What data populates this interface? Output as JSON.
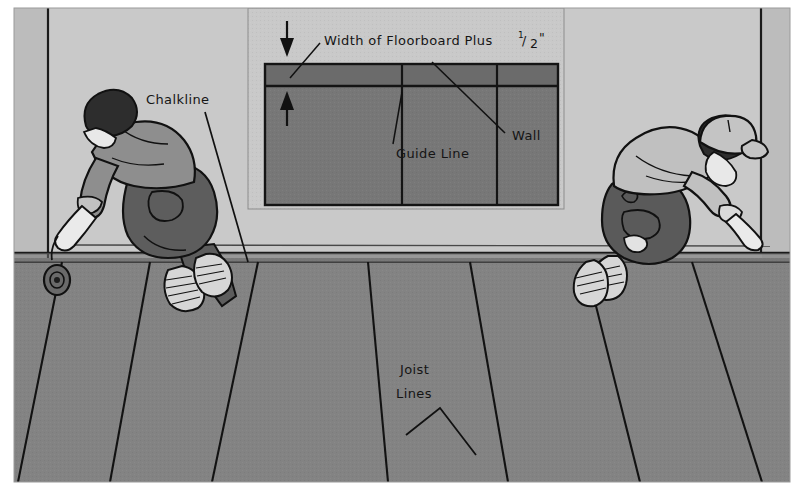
{
  "illustration": {
    "title": "Chalkline layout for floorboard installation",
    "type": "technical line illustration",
    "scene_description": "Two workers kneeling on a subfloor snapping a chalkline along a wall, with an inset detail diagram above"
  },
  "labels": {
    "chalkline": "Chalkline",
    "joist_lines_line1": "Joist",
    "joist_lines_line2": "Lines"
  },
  "inset": {
    "dimension_text_main": "Width of Floorboard Plus",
    "dimension_fraction_numerator": "1",
    "dimension_fraction_slash": "/",
    "dimension_fraction_denominator": "2",
    "dimension_unit": "\"",
    "guide_line_label": "Guide Line",
    "wall_label": "Wall"
  },
  "colors": {
    "image_border": "#ffffff",
    "wall_light": "#c9c9c9",
    "wall_side_panel": "#b9b9b9",
    "floor_main": "#838383",
    "inset_panel_bg": "#c9c9c9",
    "inset_floor": "#777777",
    "inset_wall_strip": "#6e6e6e",
    "line_dark": "#1a1a1a",
    "shirt_left": "#8a8a8a",
    "shirt_right": "#c0c0c0",
    "pants_left": "#5d5d5d",
    "pants_right": "#5a5a5a",
    "skin": "#e8e8e8",
    "hair": "#2a2a2a",
    "shoe": "#d8d8d8",
    "cap": "#c4c4c4"
  },
  "elements": {
    "left_worker": "worker-kneeling-holding-chalk-reel",
    "right_worker": "worker-kneeling-with-cap-holding-line",
    "chalk_reel": "chalk-line-reel",
    "floor_seams_count": 6,
    "inset_guide_lines_count": 2,
    "joist_pointer": "inverted-v-leader-lines"
  }
}
